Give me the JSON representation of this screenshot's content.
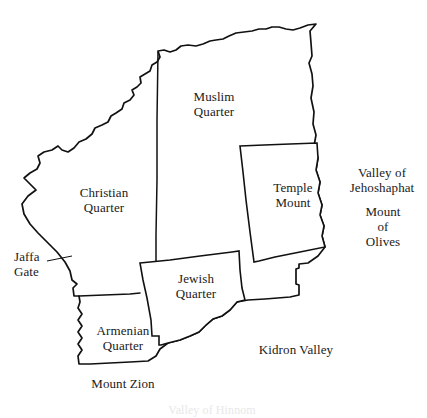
{
  "map": {
    "title": "Old City of Jerusalem — Quarters",
    "background_color": "#ffffff",
    "line_color": "#111111",
    "labels": {
      "muslim_quarter": {
        "line1": "Muslim",
        "line2": "Quarter"
      },
      "christian_quarter": {
        "line1": "Christian",
        "line2": "Quarter"
      },
      "jewish_quarter": {
        "line1": "Jewish",
        "line2": "Quarter"
      },
      "armenian_quarter": {
        "line1": "Armenian",
        "line2": "Quarter"
      },
      "temple_mount": {
        "line1": "Temple",
        "line2": "Mount"
      },
      "jaffa_gate": {
        "line1": "Jaffa",
        "line2": "Gate"
      },
      "valley_of_jehoshaphat": {
        "line1": "Valley of",
        "line2": "Jehoshaphat"
      },
      "mount_of_olives": {
        "line1": "Mount",
        "line2": "of",
        "line3": "Olives"
      },
      "kidron_valley": {
        "line1": "Kidron Valley"
      },
      "mount_zion": {
        "line1": "Mount Zion"
      },
      "valley_of_hinnom": {
        "line1": "Valley of Hinnom"
      }
    },
    "regions": [
      {
        "name": "muslim-quarter",
        "label": "Muslim Quarter"
      },
      {
        "name": "christian-quarter",
        "label": "Christian Quarter"
      },
      {
        "name": "jewish-quarter",
        "label": "Jewish Quarter"
      },
      {
        "name": "armenian-quarter",
        "label": "Armenian Quarter"
      },
      {
        "name": "temple-mount",
        "label": "Temple Mount"
      }
    ],
    "features": [
      {
        "name": "jaffa-gate",
        "label": "Jaffa Gate",
        "type": "gate"
      },
      {
        "name": "valley-of-jehoshaphat",
        "label": "Valley of Jehoshaphat",
        "type": "valley"
      },
      {
        "name": "kidron-valley",
        "label": "Kidron Valley",
        "type": "valley"
      },
      {
        "name": "valley-of-hinnom",
        "label": "Valley of Hinnom",
        "type": "valley"
      },
      {
        "name": "mount-of-olives",
        "label": "Mount of Olives",
        "type": "mount"
      },
      {
        "name": "mount-zion",
        "label": "Mount Zion",
        "type": "mount"
      }
    ]
  }
}
